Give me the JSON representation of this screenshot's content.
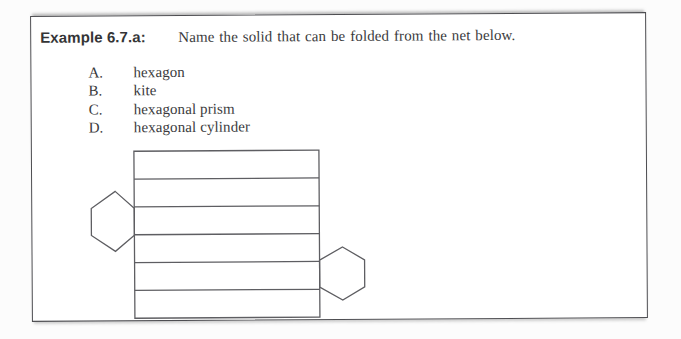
{
  "document": {
    "example_label": "Example 6.7.a:",
    "question": "Name the solid that can be folded from the net below.",
    "options": [
      {
        "letter": "A.",
        "text": "hexagon"
      },
      {
        "letter": "B.",
        "text": "kite"
      },
      {
        "letter": "C.",
        "text": "hexagonal prism"
      },
      {
        "letter": "D.",
        "text": "hexagonal cylinder"
      }
    ],
    "colors": {
      "border": "#4e4e52",
      "text": "#3a3a3c",
      "figure_stroke": "#5e5e62",
      "page_background": "#fcfcfc"
    }
  },
  "figure": {
    "type": "net-of-hexagonal-prism",
    "rect": {
      "x": 132,
      "y": 148,
      "width": 185,
      "height": 167
    },
    "strip_count": 6,
    "hexagons": [
      {
        "name": "left-hexagon-face",
        "points": [
          [
            113,
            188
          ],
          [
            132,
            205
          ],
          [
            132,
            232
          ],
          [
            113,
            248
          ],
          [
            89,
            232
          ],
          [
            89,
            205
          ]
        ]
      },
      {
        "name": "right-hexagon-face",
        "points": [
          [
            340,
            245
          ],
          [
            362,
            258
          ],
          [
            362,
            285
          ],
          [
            340,
            298
          ],
          [
            317,
            285
          ],
          [
            317,
            258
          ]
        ]
      }
    ],
    "stroke_width": 1.3
  }
}
